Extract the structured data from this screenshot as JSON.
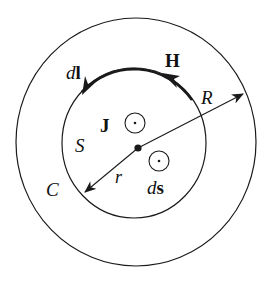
{
  "diagram": {
    "labels": {
      "dl_d": "d",
      "dl_l": "l",
      "H": "H",
      "R": "R",
      "J": "J",
      "S": "S",
      "C": "C",
      "r": "r",
      "ds_d": "d",
      "ds_s": "s"
    },
    "colors": {
      "stroke": "#1a1a1a",
      "background": "#ffffff"
    },
    "geometry": {
      "outer_circle": {
        "cx": 136,
        "cy": 142,
        "rx": 120,
        "ry": 124
      },
      "inner_circle": {
        "cx": 134,
        "cy": 143,
        "rx": 72,
        "ry": 75
      },
      "center_dot": {
        "cx": 138,
        "cy": 148
      }
    },
    "symbols": [
      {
        "name": "current-density-out-of-page",
        "meaning": "J out of page (dot in circle)"
      },
      {
        "name": "surface-element-out-of-page",
        "meaning": "ds out of page (dot in circle)"
      }
    ]
  }
}
